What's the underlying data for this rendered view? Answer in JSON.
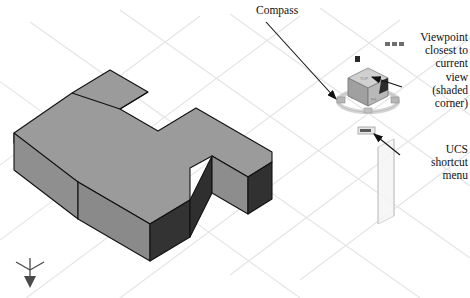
{
  "figure": {
    "background_color": "#ffffff",
    "grid_color": "#e2e2e2",
    "callouts": [
      {
        "name": "compass",
        "text": "Compass",
        "arrow_from": [
          262,
          20
        ],
        "arrow_to": [
          337,
          100
        ]
      },
      {
        "name": "viewpoint",
        "text": "Viewpoint\nclosest to\ncurrent\nview\n(shaded\ncorner)",
        "arrow_from": [
          398,
          84
        ],
        "arrow_to": [
          369,
          76
        ]
      },
      {
        "name": "ucs-shortcut-menu",
        "text": "UCS\nshortcut\nmenu",
        "arrow_from": [
          397,
          152
        ],
        "arrow_to": [
          372,
          133
        ]
      }
    ],
    "solid": {
      "name": "extruded-notched-block",
      "top_face_color": "#9a9a9a",
      "front_face_color": "#8c8c8c",
      "left_face_color": "#949494",
      "dark_face_color": "#333333",
      "edge_color": "#1a1a1a"
    },
    "viewcube": {
      "name": "view-cube",
      "top_face_color": "#cfcfcf",
      "left_face_color": "#9d9d9d",
      "right_face_color": "#b5b5b5",
      "shaded_corner_color": "#2b2b2b",
      "ring_color": "#d8d8d8"
    },
    "ucs_icon": {
      "name": "ucs-axis-icon",
      "color": "#4a4a4a"
    },
    "ucs_menu_widget": {
      "name": "ucs-menu-chip",
      "label": "WCS",
      "background": "#e8e8e8",
      "border": "#909090"
    },
    "cursor": {
      "name": "crosshair-cursor",
      "color": "#2a2a2a"
    },
    "toolbar_dots": {
      "name": "mini-toolbar",
      "count": 3,
      "color": "#6e6e6e"
    },
    "panel": {
      "name": "translucent-plane",
      "fill": "#f2f2f2",
      "border": "#cfcfcf"
    }
  }
}
